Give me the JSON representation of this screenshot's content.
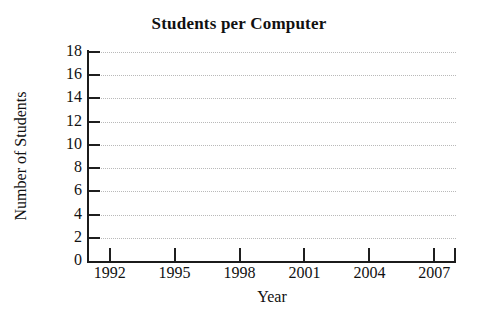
{
  "chart_data": {
    "type": "line",
    "title": "Students per Computer",
    "subtitle": "",
    "xlabel": "Year",
    "ylabel": "Number of Students",
    "x_tick_labels": [
      "1992",
      "1995",
      "1998",
      "2001",
      "2004",
      "2007"
    ],
    "x_tick_values": [
      1992,
      1995,
      1998,
      2001,
      2004,
      2007
    ],
    "y_tick_labels": [
      "0",
      "2",
      "4",
      "6",
      "8",
      "10",
      "12",
      "14",
      "16",
      "18"
    ],
    "y_tick_values": [
      0,
      2,
      4,
      6,
      8,
      10,
      12,
      14,
      16,
      18
    ],
    "xlim": [
      1991,
      2008
    ],
    "ylim": [
      0,
      18
    ],
    "y_tick_step": 2,
    "x_tick_step": 3,
    "grid": "horizontal-dotted",
    "legend": "none",
    "series": [],
    "values": [],
    "annotations": [],
    "note": "Blank plotting grid - axes and gridlines drawn, no data series plotted"
  },
  "style": {
    "background": "#ffffff",
    "axis_color": "#1b1b1b",
    "gridline_color": "#b9b9b9",
    "text_color": "#111111"
  }
}
